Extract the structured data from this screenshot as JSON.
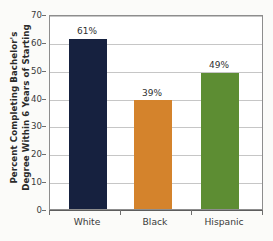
{
  "chart_data": {
    "type": "bar",
    "title": "",
    "subtitle": "",
    "xlabel": "",
    "ylabel": "Percent Completing Bachelor's Degree Within 6 Years of Starting",
    "ylabel_lines": [
      "Percent Completing Bachelor's",
      "Degree Within 6 Years of Starting"
    ],
    "categories": [
      "White",
      "Black",
      "Hispanic"
    ],
    "values": [
      61,
      39,
      49
    ],
    "data_labels": [
      "61%",
      "39%",
      "49%"
    ],
    "bar_colors": [
      "#16213f",
      "#d4832c",
      "#5d8d33"
    ],
    "ylim": [
      0,
      70
    ],
    "yticks": [
      0,
      10,
      20,
      30,
      40,
      50,
      60,
      70
    ],
    "ytick_labels": [
      "0",
      "10",
      "20",
      "30",
      "40",
      "50",
      "60",
      "70"
    ],
    "grid": true,
    "grid_axis": "y",
    "legend": false,
    "legend_position": "none",
    "background_color": "#fbfbf9",
    "plot_background_color": "#ffffff",
    "axis_color": "#8d8d8d",
    "gridline_color": "#c6c6c6"
  }
}
